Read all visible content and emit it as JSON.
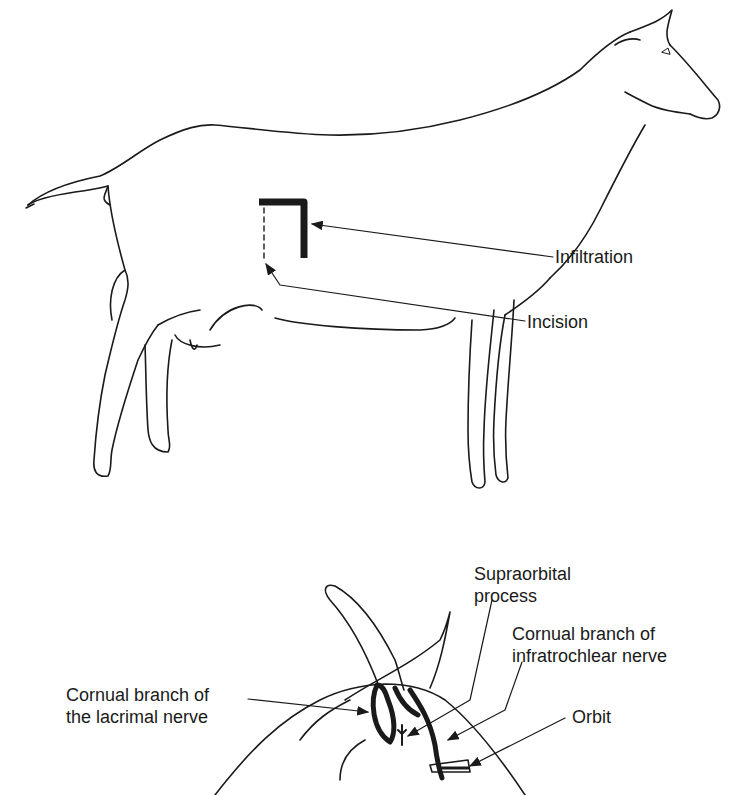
{
  "figure_top": {
    "subject": "goat-lateral-view",
    "labels": {
      "infiltration": "Infiltration",
      "incision": "Incision"
    }
  },
  "figure_bottom": {
    "subject": "goat-head-horn-base",
    "labels": {
      "supraorbital_line1": "Supraorbital",
      "supraorbital_line2": "process",
      "infratrochlear_line1": "Cornual branch of",
      "infratrochlear_line2": "infratrochlear nerve",
      "lacrimal_line1": "Cornual branch of",
      "lacrimal_line2": "the lacrimal nerve",
      "orbit": "Orbit"
    }
  },
  "colors": {
    "ink": "#1a1a1a",
    "background": "#ffffff"
  }
}
